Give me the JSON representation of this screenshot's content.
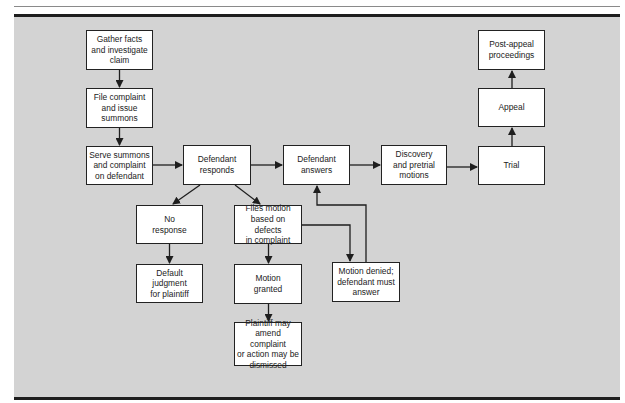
{
  "diagram": {
    "nodes": {
      "gather": "Gather facts\nand investigate\nclaim",
      "file": "File complaint\nand issue\nsummons",
      "serve": "Serve summons\nand complaint\non defendant",
      "responds": "Defendant\nresponds",
      "answers": "Defendant\nanswers",
      "discovery": "Discovery\nand pretrial\nmotions",
      "trial": "Trial",
      "appeal": "Appeal",
      "post_appeal": "Post-appeal\nproceedings",
      "no_response": "No\nresponse",
      "default_judgment": "Default\njudgment\nfor plaintiff",
      "files_motion": "Files motion\nbased on defects\nin complaint",
      "motion_granted": "Motion\ngranted",
      "plaintiff_may": "Plaintiff may\namend complaint\nor action may be\ndismissed",
      "motion_denied": "Motion denied;\ndefendant must\nanswer"
    },
    "edges": [
      [
        "gather",
        "file"
      ],
      [
        "file",
        "serve"
      ],
      [
        "serve",
        "responds"
      ],
      [
        "responds",
        "answers"
      ],
      [
        "answers",
        "discovery"
      ],
      [
        "discovery",
        "trial"
      ],
      [
        "trial",
        "appeal"
      ],
      [
        "appeal",
        "post_appeal"
      ],
      [
        "responds",
        "no_response"
      ],
      [
        "responds",
        "files_motion"
      ],
      [
        "no_response",
        "default_judgment"
      ],
      [
        "files_motion",
        "motion_granted"
      ],
      [
        "motion_granted",
        "plaintiff_may"
      ],
      [
        "files_motion",
        "motion_denied"
      ],
      [
        "motion_denied",
        "answers"
      ]
    ],
    "colors": {
      "background": "#d3d3d3",
      "box_fill": "#ffffff",
      "line": "#1e1e1e"
    }
  }
}
